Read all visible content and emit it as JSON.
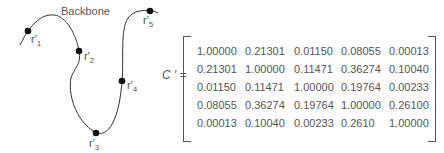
{
  "figure": {
    "backbone_label": "Backbone",
    "points": [
      {
        "id": "r1",
        "label": "r",
        "prime": "′",
        "sub": "1",
        "x": 28,
        "y": 31
      },
      {
        "id": "r2",
        "label": "r",
        "prime": "′",
        "sub": "2",
        "x": 79,
        "y": 51
      },
      {
        "id": "r3",
        "label": "r",
        "prime": "′",
        "sub": "3",
        "x": 96,
        "y": 133
      },
      {
        "id": "r4",
        "label": "r",
        "prime": "′",
        "sub": "4",
        "x": 122,
        "y": 81
      },
      {
        "id": "r5",
        "label": "r",
        "prime": "′",
        "sub": "5",
        "x": 150,
        "y": 11
      }
    ]
  },
  "equation": {
    "lhs": "C ′ ="
  },
  "matrix": {
    "rows": [
      [
        "1.00000",
        "0.21301",
        "0.01150",
        "0.08055",
        "0.00013"
      ],
      [
        "0.21301",
        "1.00000",
        "0.11471",
        "0.36274",
        "0.10040"
      ],
      [
        "0.01150",
        "0.11471",
        "1.00000",
        "0.19764",
        "0.00233"
      ],
      [
        "0.08055",
        "0.36274",
        "0.19764",
        "1.00000",
        "0.26100"
      ],
      [
        "0.00013",
        "0.10040",
        "0.00233",
        "0.2610",
        "1.00000"
      ]
    ]
  }
}
